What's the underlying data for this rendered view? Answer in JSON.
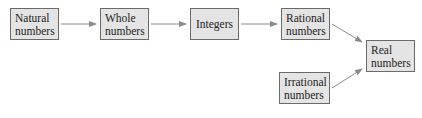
{
  "diagram": {
    "nodes": [
      {
        "id": "natural",
        "line1": "Natural",
        "line2": "numbers"
      },
      {
        "id": "whole",
        "line1": "Whole",
        "line2": "numbers"
      },
      {
        "id": "integers",
        "line1": "Integers"
      },
      {
        "id": "rational",
        "line1": "Rational",
        "line2": "numbers"
      },
      {
        "id": "real",
        "line1": "Real",
        "line2": "numbers"
      },
      {
        "id": "irrational",
        "line1": "Irrational",
        "line2": "numbers"
      }
    ],
    "edges": [
      {
        "from": "natural",
        "to": "whole"
      },
      {
        "from": "whole",
        "to": "integers"
      },
      {
        "from": "integers",
        "to": "rational"
      },
      {
        "from": "rational",
        "to": "real"
      },
      {
        "from": "irrational",
        "to": "real"
      }
    ],
    "colors": {
      "box_fill": "#e4e4e4",
      "border": "#6a6a6a",
      "arrow": "#8a8a8a"
    }
  }
}
